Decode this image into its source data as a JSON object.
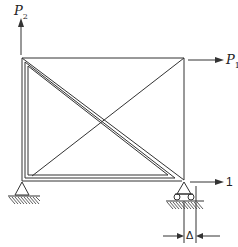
{
  "diagram": {
    "type": "structural-frame",
    "colors": {
      "stroke": "#333333",
      "background": "#ffffff"
    },
    "loads": {
      "p2": {
        "symbol": "P",
        "subscript": "2",
        "direction": "up",
        "location": "top-left joint"
      },
      "p1": {
        "symbol": "P",
        "subscript": "1",
        "direction": "right",
        "location": "top-right joint"
      },
      "unit": {
        "label": "1",
        "direction": "right",
        "location": "bottom-right support"
      }
    },
    "supports": {
      "left": "pin",
      "right": "roller"
    },
    "dimension": {
      "label": "Δ",
      "meaning": "horizontal displacement at roller support"
    }
  }
}
